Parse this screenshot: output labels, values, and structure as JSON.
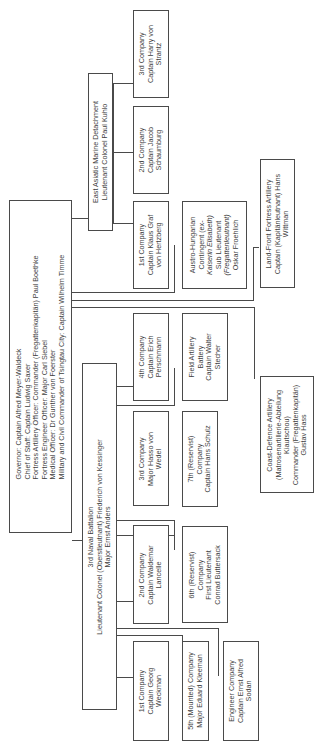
{
  "chart_title": "Organisation of the Tsingtau garrison",
  "governor": {
    "lines": [
      "Governor: Captain Alfred Meyer-Waldeck",
      "Chief of Staff: Captain Ludwig Saxer",
      "Fortress Artillery Officer: Commander (Fregattenkapitän) Paul Boethke",
      "Fortress Engineer Officer: Major Carl Siebel",
      "Medical Officer: Dr Gunther von Foerster",
      "Military and Civil Commander of Tsingtau City: Captain Wilhelm Timme"
    ]
  },
  "east_asiatic": {
    "lines": [
      "East Asiatic Marine Detachment",
      "Lieutenant Colonel Paul Kuhlo"
    ],
    "companies": [
      {
        "lines": [
          "1st Company",
          "Captain Klaus Graf",
          "von Hertzberg"
        ]
      },
      {
        "lines": [
          "2nd Company",
          "Captain Jacob",
          "Schaumburg"
        ]
      },
      {
        "lines": [
          "3rd Company",
          "Captain Harry von",
          "Strantz"
        ]
      }
    ]
  },
  "austro_hungarian": {
    "lines": [
      "Austro-Hungarian",
      "Contingent (ex-",
      "Kaiserin Elisabeth)",
      "Sub Lieutenant",
      "(Fregattenleutnant)",
      "Oskar Froehlich"
    ]
  },
  "land_front": {
    "lines": [
      "Land-Front Fortress Artillery",
      "Captain (Kapitänleutnant) Hans",
      "Wittman"
    ]
  },
  "coast_defence": {
    "lines": [
      "Coast-Defence Artillery",
      "(Matrosenartillerie-Abteilung",
      "Kiautschou)",
      "Commander (Fregattenkapitän)",
      "Gustav Hass"
    ]
  },
  "field_artillery": {
    "lines": [
      "Field Artillery",
      "Battery",
      "Captain Walter",
      "Stecher"
    ]
  },
  "battalion": {
    "lines": [
      "3rd Naval Battalion",
      "Lieutenant Colonel (Oberstleutnant) Friederich von Kessinger",
      "Major Ernst Anders"
    ],
    "companies": [
      {
        "lines": [
          "1st Company",
          "Captain Georg",
          "Weckman"
        ]
      },
      {
        "lines": [
          "2nd Company",
          "Captain Waldemar",
          "Lancelle"
        ]
      },
      {
        "lines": [
          "3rd Company",
          "Major Hasso von",
          "Wedel"
        ]
      },
      {
        "lines": [
          "4th Company",
          "Captain Erich",
          "Perschmann"
        ]
      },
      {
        "lines": [
          "5th (Mounted) Company",
          "Major Eduard Kleeman"
        ]
      },
      {
        "lines": [
          "6th (Reservist)",
          "Company",
          "First Lieutenant",
          "Conrad Buttersack"
        ]
      },
      {
        "lines": [
          "7th (Reservist)",
          "Company",
          "Captain Hans Schulz"
        ]
      },
      {
        "lines": [
          "Engineer Company",
          "Captain Ernst Alfred",
          "Sodan"
        ]
      }
    ]
  }
}
